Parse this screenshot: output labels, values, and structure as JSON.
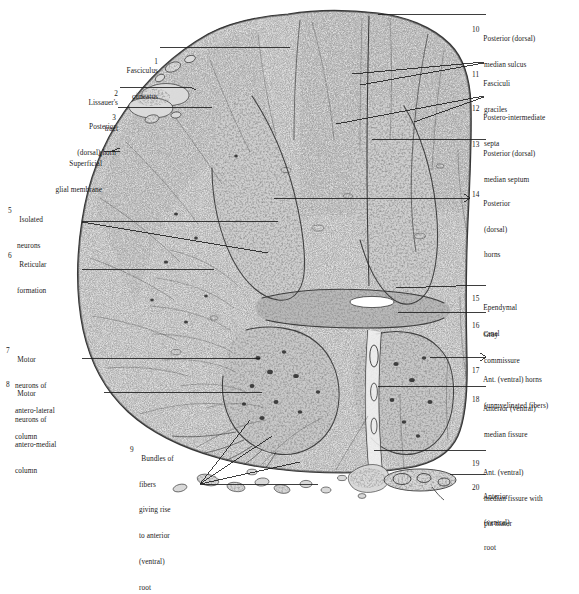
{
  "figure": {
    "kind": "histological-plate",
    "background_color": "#ffffff",
    "ink_color": "#1a1a1a",
    "specimen_tone": "#8d8d8d"
  },
  "labels_left": [
    {
      "num": "1",
      "lines": [
        "Fasciculus",
        "cuneatus"
      ]
    },
    {
      "num": "2",
      "lines": [
        "Lissauer's",
        "tract"
      ]
    },
    {
      "num": "3",
      "lines": [
        "Posterior",
        "(dorsal) horn"
      ]
    },
    {
      "num": "4",
      "lines": [
        "Superficial",
        "glial membrane"
      ]
    },
    {
      "num": "5",
      "lines": [
        "Isolated",
        "neurons"
      ]
    },
    {
      "num": "6",
      "lines": [
        "Reticular",
        "formation"
      ]
    },
    {
      "num": "7",
      "lines": [
        "Motor",
        "neurons of",
        "antero-lateral",
        "column"
      ]
    },
    {
      "num": "8",
      "lines": [
        "Motor",
        "neurons of",
        "antero-medial",
        "column"
      ]
    },
    {
      "num": "9",
      "lines": [
        "Bundles of",
        "fibers",
        "giving rise",
        "to anterior",
        "(ventral)",
        "root"
      ]
    }
  ],
  "labels_right": [
    {
      "num": "10",
      "lines": [
        "Posterior (dorsal)",
        "median sulcus"
      ]
    },
    {
      "num": "11",
      "lines": [
        "Fasciculi",
        "graciles"
      ]
    },
    {
      "num": "12",
      "lines": [
        "Postero-intermediate",
        "septa"
      ]
    },
    {
      "num": "13",
      "lines": [
        "Posterior (dorsal)",
        "median septum"
      ]
    },
    {
      "num": "14",
      "lines": [
        "Posterior",
        "(dorsal)",
        "horns"
      ]
    },
    {
      "num": "15",
      "lines": [
        "Ependymal",
        "canal"
      ]
    },
    {
      "num": "16",
      "lines": [
        "Gray",
        "commissure"
      ]
    },
    {
      "num": "17",
      "lines": [
        "Ant. (ventral) horns",
        "(unmyelinated fibers)"
      ]
    },
    {
      "num": "18",
      "lines": [
        "Anterior (ventral)",
        "median fissure"
      ]
    },
    {
      "num": "19",
      "lines": [
        "Ant. (ventral)",
        "median fissure with",
        "pia mater"
      ]
    },
    {
      "num": "20",
      "lines": [
        "Anterior",
        "(ventral)",
        "root"
      ]
    }
  ]
}
